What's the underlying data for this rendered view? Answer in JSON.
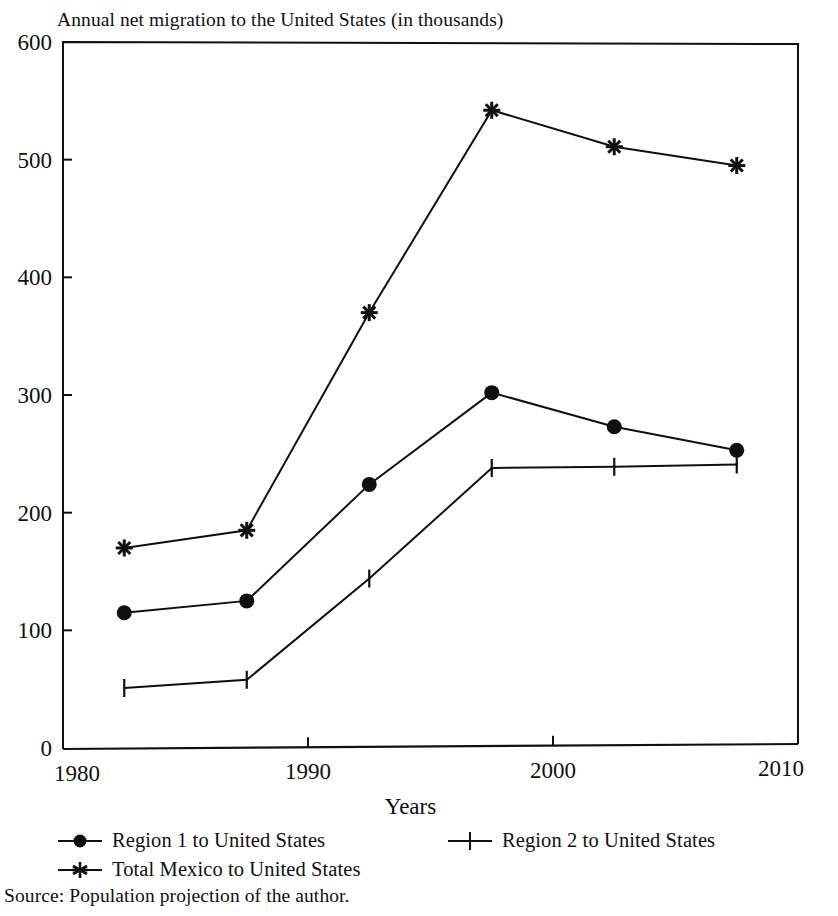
{
  "page": {
    "clipped_top_text": "",
    "source_note": "Source: Population projection of the author."
  },
  "chart": {
    "title": "Annual net migration to the United States (in thousands)",
    "xlabel": "Years",
    "ylabel": ""
  },
  "legend": {
    "entries": [
      {
        "label": "Region 1 to United States",
        "marker": "filled-circle-icon"
      },
      {
        "label": "Region 2 to United States",
        "marker": "plus-icon"
      },
      {
        "label": "Total Mexico to United States",
        "marker": "asterisk-icon"
      }
    ]
  },
  "chart_data": {
    "type": "line",
    "title": "Annual net migration to the United States (in thousands)",
    "xlabel": "Years",
    "ylabel": "",
    "xlim": [
      1980,
      2010
    ],
    "ylim": [
      0,
      600
    ],
    "xticks": [
      1980,
      1990,
      2000,
      2010
    ],
    "xtick_labels": [
      "1980",
      "1990",
      "2000",
      "2010"
    ],
    "yticks": [
      0,
      100,
      200,
      300,
      400,
      500,
      600
    ],
    "ytick_labels": [
      "0",
      "100",
      "200",
      "300",
      "400",
      "500",
      "600"
    ],
    "grid": false,
    "legend_position": "below-axes",
    "x": [
      1982.5,
      1987.5,
      1992.5,
      1997.5,
      2002.5,
      2007.5
    ],
    "series": [
      {
        "name": "Region 1 to United States",
        "marker": "filled-circle",
        "values": [
          115,
          125,
          224,
          302,
          273,
          253
        ]
      },
      {
        "name": "Region 2 to United States",
        "marker": "plus",
        "values": [
          51,
          58,
          144,
          238,
          239,
          241
        ]
      },
      {
        "name": "Total Mexico to United States",
        "marker": "asterisk",
        "values": [
          170,
          185,
          370,
          542,
          511,
          495
        ]
      }
    ]
  }
}
